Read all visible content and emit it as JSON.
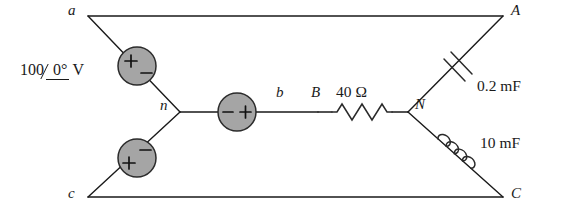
{
  "figure": {
    "type": "circuit-diagram",
    "background_color": "#ffffff",
    "line_color": "#1a1a1a",
    "source_fill_color": "#a5a5a5"
  },
  "source_label": {
    "magnitude": "100",
    "angle": "0°",
    "unit": "V",
    "full": "100∠0° V"
  },
  "nodes": [
    {
      "id": "a",
      "label": "a",
      "x": 88,
      "y": 16
    },
    {
      "id": "n",
      "label": "n",
      "x": 180,
      "y": 112
    },
    {
      "id": "c",
      "label": "c",
      "x": 88,
      "y": 197
    },
    {
      "id": "b",
      "label": "b",
      "x": 281,
      "y": 112
    },
    {
      "id": "A",
      "label": "A",
      "x": 503,
      "y": 16
    },
    {
      "id": "N",
      "label": "N",
      "x": 408,
      "y": 112
    },
    {
      "id": "C",
      "label": "C",
      "x": 503,
      "y": 197
    },
    {
      "id": "B",
      "label": "B",
      "x": 318,
      "y": 112
    }
  ],
  "sources": [
    {
      "id": "source-a-n",
      "name": "voltage-source-a-n",
      "plus": "+",
      "minus": "−",
      "cx": 137,
      "cy": 66
    },
    {
      "id": "source-c-n",
      "name": "voltage-source-c-n",
      "plus": "+",
      "minus": "−",
      "cx": 137,
      "cy": 158
    },
    {
      "id": "source-n-b",
      "name": "voltage-source-n-b",
      "plus": "+",
      "minus": "−",
      "cx": 237,
      "cy": 112
    }
  ],
  "components": [
    {
      "id": "resistor-B-N",
      "name": "resistor",
      "symbol": "zigzag",
      "value": "40",
      "unit": "Ω",
      "label": "40 Ω"
    },
    {
      "id": "capacitor-N-A",
      "name": "capacitor",
      "symbol": "parallel-plates",
      "value": "0.2",
      "unit": "mF",
      "label": "0.2 mF"
    },
    {
      "id": "inductor-N-C",
      "name": "inductor",
      "symbol": "coil",
      "value": "10",
      "unit": "mF",
      "label": "10 mF"
    }
  ],
  "labels": {
    "resistor_value": "40 Ω",
    "capacitor_value": "0.2 mF",
    "inductor_value": "10 mF"
  }
}
